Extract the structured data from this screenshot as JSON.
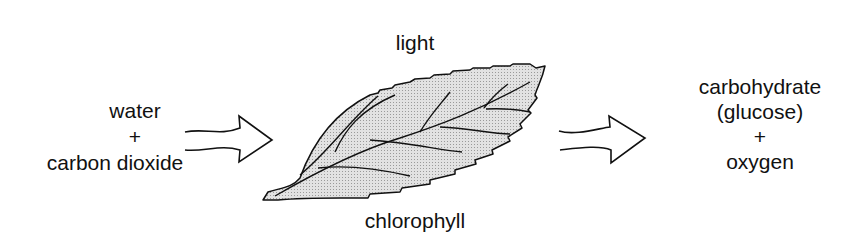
{
  "diagram": {
    "inputs": {
      "line1": "water",
      "plus": "+",
      "line2": "carbon dioxide"
    },
    "above_leaf": "light",
    "below_leaf": "chlorophyll",
    "outputs": {
      "line1": "carbohydrate",
      "line2": "(glucose)",
      "plus": "+",
      "line3": "oxygen"
    },
    "colors": {
      "leaf_fill": "#d4d4d4",
      "stroke": "#111111"
    }
  }
}
